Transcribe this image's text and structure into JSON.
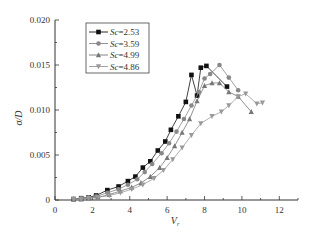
{
  "chart_data": {
    "type": "line",
    "title": "",
    "xlabel": "V_r",
    "ylabel": "σ/D",
    "xlim": [
      0,
      13
    ],
    "ylim": [
      0,
      0.02
    ],
    "xticks": [
      0,
      2,
      4,
      6,
      8,
      10,
      12
    ],
    "xtick_labels": [
      "0",
      "2",
      "4",
      "6",
      "8",
      "10",
      "12"
    ],
    "yticks": [
      0,
      0.005,
      0.01,
      0.015,
      0.02
    ],
    "ytick_labels": [
      "0",
      "0.005",
      "0.010",
      "0.015",
      "0.020"
    ],
    "grid": false,
    "legend_position": "upper-left-inside",
    "series": [
      {
        "name": "Sc=2.53",
        "marker": "square",
        "color": "#111111",
        "x": [
          1.0,
          1.4,
          1.8,
          2.2,
          2.8,
          3.4,
          3.9,
          4.3,
          4.7,
          5.1,
          5.5,
          5.9,
          6.2,
          6.6,
          7.0,
          7.3,
          7.6,
          7.8,
          8.1,
          9.2
        ],
        "y": [
          0.0001,
          0.0002,
          0.0003,
          0.0005,
          0.0011,
          0.0015,
          0.0021,
          0.0026,
          0.0036,
          0.0043,
          0.0055,
          0.0065,
          0.0078,
          0.0093,
          0.0109,
          0.0139,
          0.0116,
          0.0147,
          0.0149,
          0.0126
        ]
      },
      {
        "name": "Sc=3.59",
        "marker": "circle",
        "color": "#888888",
        "x": [
          1.0,
          1.4,
          1.8,
          2.2,
          2.8,
          3.4,
          3.9,
          4.4,
          4.8,
          5.2,
          5.7,
          6.1,
          6.5,
          6.9,
          7.3,
          7.7,
          8.0,
          8.3,
          8.8,
          9.3,
          9.8
        ],
        "y": [
          0.0001,
          0.0002,
          0.0003,
          0.0004,
          0.0008,
          0.0012,
          0.0017,
          0.0023,
          0.0031,
          0.004,
          0.0052,
          0.0063,
          0.0076,
          0.009,
          0.0105,
          0.012,
          0.0135,
          0.014,
          0.015,
          0.0136,
          0.0122
        ]
      },
      {
        "name": "Sc=4.99",
        "marker": "triangle-up",
        "color": "#777777",
        "x": [
          1.0,
          1.4,
          1.8,
          2.3,
          2.9,
          3.5,
          4.1,
          4.6,
          5.1,
          5.6,
          6.0,
          6.4,
          6.8,
          7.2,
          7.6,
          8.0,
          8.4,
          8.8,
          9.3,
          9.8,
          10.5
        ],
        "y": [
          0.0001,
          0.0001,
          0.0002,
          0.0003,
          0.0006,
          0.001,
          0.0014,
          0.0019,
          0.0026,
          0.0036,
          0.0047,
          0.006,
          0.0075,
          0.009,
          0.011,
          0.0127,
          0.013,
          0.013,
          0.012,
          0.0115,
          0.0098
        ]
      },
      {
        "name": "Sc=4.86",
        "marker": "triangle-down",
        "color": "#999999",
        "x": [
          1.0,
          1.4,
          1.8,
          2.3,
          2.9,
          3.5,
          4.1,
          4.7,
          5.3,
          5.8,
          6.3,
          6.8,
          7.3,
          7.8,
          8.4,
          8.9,
          9.3,
          9.8,
          10.2,
          10.8,
          11.1
        ],
        "y": [
          0.0001,
          0.0001,
          0.0002,
          0.0003,
          0.0005,
          0.0008,
          0.0012,
          0.0017,
          0.0024,
          0.0033,
          0.0045,
          0.0058,
          0.0072,
          0.0085,
          0.0093,
          0.0098,
          0.0105,
          0.0115,
          0.0118,
          0.0107,
          0.0108
        ]
      }
    ]
  },
  "legend": {
    "items": [
      {
        "prefix": "Sc",
        "suffix": "=2.53"
      },
      {
        "prefix": "Sc",
        "suffix": "=3.59"
      },
      {
        "prefix": "Sc",
        "suffix": "=4.99"
      },
      {
        "prefix": "Sc",
        "suffix": "=4.86"
      }
    ]
  },
  "axes": {
    "x_title": "V",
    "x_title_sub": "r",
    "y_title": "σ/D"
  }
}
